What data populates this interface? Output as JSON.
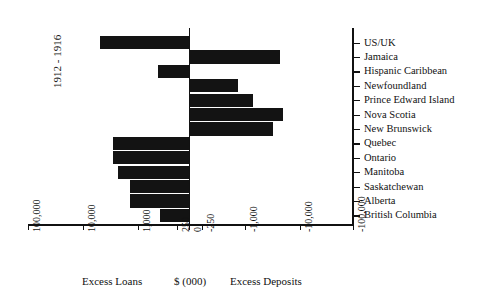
{
  "chart_data": {
    "type": "bar",
    "orientation": "horizontal",
    "title": "",
    "subtitle": "",
    "period_label": "1912 - 1916",
    "xlabel": "$ (000)",
    "ylabel": "",
    "left_caption": "Excess Loans",
    "right_caption": "Excess Deposits",
    "units_caption": "$ (000)",
    "scale": "symmetric-log",
    "x_tick_labels": [
      "100,000",
      "10,000",
      "1,000",
      "250",
      "0",
      "-250",
      "-1,000",
      "-10,000",
      "-100,000"
    ],
    "x_tick_values": [
      100000,
      10000,
      1000,
      250,
      0,
      -250,
      -1000,
      -10000,
      -100000
    ],
    "xlim": [
      100000,
      -100000
    ],
    "grid": false,
    "legend": "none",
    "categories": [
      "US/UK",
      "Jamaica",
      "Hispanic Caribbean",
      "Newfoundland",
      "Prince Edward Island",
      "Nova Scotia",
      "New Brunswick",
      "Quebec",
      "Ontario",
      "Manitoba",
      "Saskatchewan",
      "Alberta",
      "British Columbia"
    ],
    "values": [
      6500,
      -6000,
      0,
      -700,
      -1300,
      -7000,
      -4000,
      2700,
      2700,
      1900,
      900,
      900,
      280
    ]
  },
  "bars": [
    {
      "category": "US/UK",
      "direction": "loans",
      "start_px": 100,
      "end_px": 189
    },
    {
      "category": "Jamaica",
      "direction": "deposits",
      "start_px": 189,
      "end_px": 280
    },
    {
      "category": "Hispanic Caribbean",
      "direction": "loans",
      "start_px": 158,
      "end_px": 189
    },
    {
      "category": "Newfoundland",
      "direction": "deposits",
      "start_px": 189,
      "end_px": 238
    },
    {
      "category": "Prince Edward Island",
      "direction": "deposits",
      "start_px": 189,
      "end_px": 253
    },
    {
      "category": "Nova Scotia",
      "direction": "deposits",
      "start_px": 189,
      "end_px": 283
    },
    {
      "category": "New Brunswick",
      "direction": "deposits",
      "start_px": 189,
      "end_px": 273
    },
    {
      "category": "Quebec",
      "direction": "loans",
      "start_px": 113,
      "end_px": 189
    },
    {
      "category": "Ontario",
      "direction": "loans",
      "start_px": 113,
      "end_px": 189
    },
    {
      "category": "Manitoba",
      "direction": "loans",
      "start_px": 118,
      "end_px": 189
    },
    {
      "category": "Saskatchewan",
      "direction": "loans",
      "start_px": 130,
      "end_px": 189
    },
    {
      "category": "Alberta",
      "direction": "loans",
      "start_px": 130,
      "end_px": 189
    },
    {
      "category": "British Columbia",
      "direction": "loans",
      "start_px": 160,
      "end_px": 189
    }
  ],
  "x_ticks": [
    {
      "label": "100,000",
      "x_px": 28
    },
    {
      "label": "10,000",
      "x_px": 83
    },
    {
      "label": "1,000",
      "x_px": 138
    },
    {
      "label": "250",
      "x_px": 177
    },
    {
      "label": "0",
      "x_px": 189
    },
    {
      "label": "-250",
      "x_px": 202
    },
    {
      "label": "-1,000",
      "x_px": 245
    },
    {
      "label": "-10,000",
      "x_px": 300
    },
    {
      "label": "-100,000",
      "x_px": 353
    }
  ]
}
